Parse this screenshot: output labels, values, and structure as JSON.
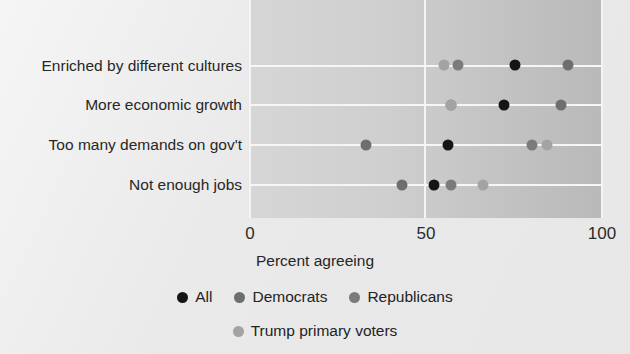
{
  "chart_data": {
    "type": "scatter",
    "title": "",
    "xlabel": "Percent agreeing",
    "ylabel": "",
    "xlim": [
      0,
      100
    ],
    "xticks": [
      "0",
      "50",
      "100"
    ],
    "xtick_values": [
      0,
      50,
      100
    ],
    "grid": true,
    "legend_position": "bottom",
    "categories": [
      "Enriched by different cultures",
      "More economic growth",
      "Too many demands on gov't",
      "Not enough jobs"
    ],
    "series": [
      {
        "name": "All",
        "color": "#151515",
        "values": [
          75,
          72,
          56,
          52
        ]
      },
      {
        "name": "Democrats",
        "color": "#6e6e6e",
        "values": [
          90,
          88,
          33,
          43
        ]
      },
      {
        "name": "Republicans",
        "color": "#7b7b7b",
        "values": [
          59,
          57,
          80,
          57
        ]
      },
      {
        "name": "Trump primary voters",
        "color": "#a3a3a3",
        "values": [
          55,
          57,
          84,
          66
        ]
      }
    ]
  },
  "axis": {
    "x_title": "Percent agreeing",
    "ticks": [
      {
        "label": "0",
        "value": 0
      },
      {
        "label": "50",
        "value": 50
      },
      {
        "label": "100",
        "value": 100
      }
    ]
  },
  "legend": {
    "row1": [
      {
        "label": "All",
        "color": "#151515"
      },
      {
        "label": "Democrats",
        "color": "#6e6e6e"
      },
      {
        "label": "Republicans",
        "color": "#7b7b7b"
      }
    ],
    "row2": [
      {
        "label": "Trump primary voters",
        "color": "#a3a3a3"
      }
    ]
  }
}
